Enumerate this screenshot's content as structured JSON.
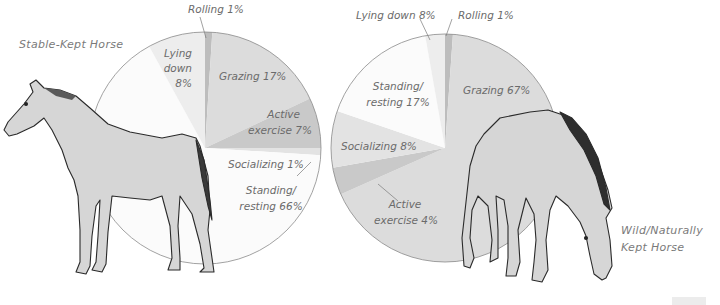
{
  "figure": {
    "left_title": "Stable-Kept Horse",
    "right_title_line1": "Wild/Naturally",
    "right_title_line2": "Kept Horse"
  },
  "labels": {
    "left": {
      "rolling": "Rolling 1%",
      "lying_1": "Lying",
      "lying_2": "down",
      "lying_3": "8%",
      "grazing": "Grazing 17%",
      "active_1": "Active",
      "active_2": "exercise 7%",
      "socializing": "Socializing 1%",
      "standing_1": "Standing/",
      "standing_2": "resting 66%"
    },
    "right": {
      "lying": "Lying down 8%",
      "rolling": "Rolling 1%",
      "standing_1": "Standing/",
      "standing_2": "resting 17%",
      "grazing": "Grazing 67%",
      "socializing": "Socializing 8%",
      "active_1": "Active",
      "active_2": "exercise 4%"
    }
  },
  "colors": {
    "rolling": "#bdbdbd",
    "grazing": "#dcdcdc",
    "active_exercise": "#c9c9c9",
    "socializing": "#e3e3e3",
    "standing_resting": "#fbfbfb",
    "lying_down": "#ededed",
    "outline": "#8a8a8a",
    "text": "#6b6b6b"
  },
  "chart_data": [
    {
      "type": "pie",
      "title": "Stable-Kept Horse",
      "start_angle": "12 o'clock, clockwise",
      "categories": [
        "Rolling",
        "Grazing",
        "Active exercise",
        "Socializing",
        "Standing/resting",
        "Lying down"
      ],
      "values": [
        1,
        17,
        7,
        1,
        66,
        8
      ],
      "unit": "%"
    },
    {
      "type": "pie",
      "title": "Wild/Naturally Kept Horse",
      "start_angle": "12 o'clock, clockwise",
      "categories": [
        "Rolling",
        "Grazing",
        "Active exercise",
        "Socializing",
        "Standing/resting",
        "Lying down"
      ],
      "values": [
        1,
        67,
        4,
        8,
        17,
        8
      ],
      "unit": "%"
    }
  ]
}
